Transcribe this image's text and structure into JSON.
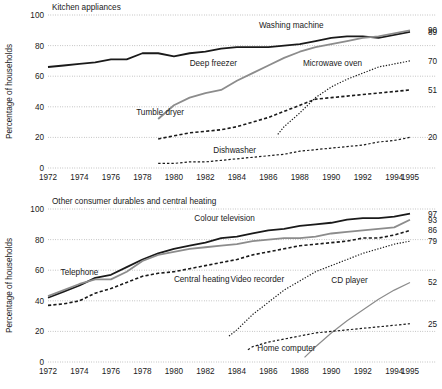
{
  "figure": {
    "axis_title": "Percentage of households",
    "x_ticks": [
      "1972",
      "1974",
      "1976",
      "1978",
      "1980",
      "1982",
      "1984",
      "1986",
      "1988",
      "1990",
      "1992",
      "1994",
      "1995"
    ],
    "x_tick_values": [
      1972,
      1974,
      1976,
      1978,
      1980,
      1982,
      1984,
      1986,
      1988,
      1990,
      1992,
      1994,
      1995
    ],
    "y_ticks": [
      "0",
      "20",
      "40",
      "60",
      "80",
      "100"
    ],
    "y_tick_values": [
      0,
      20,
      40,
      60,
      80,
      100
    ]
  },
  "chart_data": [
    {
      "type": "line",
      "title": "Kitchen appliances",
      "xlabel": "",
      "ylabel": "Percentage of households",
      "xlim": [
        1972,
        1995
      ],
      "ylim": [
        0,
        100
      ],
      "grid": true,
      "legend": "inline-annotations",
      "series": [
        {
          "name": "Washing machine",
          "end_label": "89",
          "color": "#1a1a1a",
          "width": 1.8,
          "dash": "none",
          "label_x": 1985.4,
          "label_y": 91.5,
          "x": [
            1972,
            1973,
            1974,
            1975,
            1976,
            1977,
            1978,
            1979,
            1980,
            1981,
            1982,
            1983,
            1984,
            1985,
            1986,
            1987,
            1988,
            1989,
            1990,
            1991,
            1992,
            1993,
            1994,
            1995
          ],
          "y": [
            66,
            67,
            68,
            69,
            71,
            71,
            75,
            75,
            73,
            75,
            76,
            78,
            79,
            79,
            79,
            80,
            81,
            83,
            85,
            86,
            86,
            85,
            87,
            89
          ]
        },
        {
          "name": "Deep freezer",
          "end_label": "90",
          "color": "#8c8c8c",
          "width": 1.8,
          "dash": "none",
          "label_x": 1981.0,
          "label_y": 66.5,
          "x": [
            1979,
            1980,
            1981,
            1982,
            1983,
            1984,
            1985,
            1986,
            1987,
            1988,
            1989,
            1990,
            1991,
            1992,
            1993,
            1994,
            1995
          ],
          "y": [
            32,
            41,
            46,
            49,
            51,
            57,
            62,
            67,
            72,
            76,
            79,
            81,
            83,
            85,
            86,
            88,
            90
          ]
        },
        {
          "name": "Tumble dryer",
          "end_label": "51",
          "color": "#1a1a1a",
          "width": 1.6,
          "dash": "3.2 2.2",
          "label_x": 1977.6,
          "label_y": 34.5,
          "x": [
            1979,
            1980,
            1981,
            1982,
            1983,
            1984,
            1985,
            1986,
            1987,
            1988,
            1989,
            1990,
            1991,
            1992,
            1993,
            1994,
            1995
          ],
          "y": [
            19,
            21,
            23,
            24,
            25,
            27,
            30,
            33,
            37,
            41,
            45,
            46,
            47,
            48,
            49,
            50,
            51
          ]
        },
        {
          "name": "Microwave oven",
          "end_label": "70",
          "color": "#1a1a1a",
          "width": 1.2,
          "dash": "1.3 1.6",
          "label_x": 1988.2,
          "label_y": 66.5,
          "x": [
            1986.6,
            1987,
            1988,
            1989,
            1990,
            1991,
            1992,
            1993,
            1994,
            1995
          ],
          "y": [
            22,
            27,
            36,
            46,
            53,
            58,
            62,
            66,
            68,
            70
          ]
        },
        {
          "name": "Dishwasher",
          "end_label": "20",
          "color": "#1a1a1a",
          "width": 1.2,
          "dash": "2.4 2.0",
          "label_x": 1982.5,
          "label_y": 10.0,
          "x": [
            1979,
            1980,
            1981,
            1982,
            1983,
            1984,
            1985,
            1986,
            1987,
            1988,
            1989,
            1990,
            1991,
            1992,
            1993,
            1994,
            1995
          ],
          "y": [
            3,
            3,
            4,
            4,
            5,
            6,
            7,
            8,
            9,
            11,
            12,
            13,
            14,
            15,
            17,
            18,
            20
          ]
        }
      ]
    },
    {
      "type": "line",
      "title": "Other consumer durables and central heating",
      "xlabel": "",
      "ylabel": "Percentage of households",
      "xlim": [
        1972,
        1995
      ],
      "ylim": [
        0,
        100
      ],
      "grid": true,
      "legend": "inline-annotations",
      "series": [
        {
          "name": "Colour television",
          "end_label": "97",
          "color": "#1a1a1a",
          "width": 1.8,
          "dash": "none",
          "label_x": 1981.3,
          "label_y": 92.0,
          "x": [
            1972,
            1973,
            1974,
            1975,
            1976,
            1977,
            1978,
            1979,
            1980,
            1981,
            1982,
            1983,
            1984,
            1985,
            1986,
            1987,
            1988,
            1989,
            1990,
            1991,
            1992,
            1993,
            1994,
            1995
          ],
          "y": [
            42,
            46,
            50,
            55,
            57,
            62,
            67,
            71,
            74,
            76,
            78,
            81,
            82,
            84,
            86,
            87,
            89,
            90,
            91,
            93,
            94,
            94,
            95,
            97
          ]
        },
        {
          "name": "Telephone",
          "end_label": "93",
          "color": "#8c8c8c",
          "width": 1.8,
          "dash": "none",
          "label_x": 1972.8,
          "label_y": 57.0,
          "x": [
            1972,
            1973,
            1974,
            1975,
            1976,
            1977,
            1978,
            1979,
            1980,
            1981,
            1982,
            1983,
            1984,
            1985,
            1986,
            1987,
            1988,
            1989,
            1990,
            1991,
            1992,
            1993,
            1994,
            1995
          ],
          "y": [
            43,
            47,
            51,
            54,
            54,
            59,
            66,
            70,
            72,
            74,
            75,
            76,
            77,
            79,
            80,
            81,
            81,
            82,
            84,
            85,
            86,
            87,
            88,
            93
          ]
        },
        {
          "name": "Central heating",
          "end_label": "86",
          "color": "#1a1a1a",
          "width": 1.6,
          "dash": "3.2 2.2",
          "label_x": 1980.0,
          "label_y": 52.0,
          "x": [
            1972,
            1973,
            1974,
            1975,
            1976,
            1977,
            1978,
            1979,
            1980,
            1981,
            1982,
            1983,
            1984,
            1985,
            1986,
            1987,
            1988,
            1989,
            1990,
            1991,
            1992,
            1993,
            1994,
            1995
          ],
          "y": [
            37,
            38,
            40,
            45,
            48,
            52,
            56,
            58,
            59,
            61,
            63,
            65,
            67,
            70,
            72,
            74,
            76,
            77,
            78,
            79,
            81,
            81,
            83,
            86
          ]
        },
        {
          "name": "Video recorder",
          "end_label": "79",
          "color": "#1a1a1a",
          "width": 1.2,
          "dash": "1.3 1.6",
          "label_x": 1983.6,
          "label_y": 52.0,
          "x": [
            1983.5,
            1984,
            1985,
            1986,
            1987,
            1988,
            1989,
            1990,
            1991,
            1992,
            1993,
            1994,
            1995
          ],
          "y": [
            17,
            21,
            31,
            39,
            47,
            53,
            59,
            63,
            67,
            71,
            74,
            77,
            79
          ]
        },
        {
          "name": "CD player",
          "end_label": "52",
          "color": "#8c8c8c",
          "width": 1.2,
          "dash": "none",
          "label_x": 1990.0,
          "label_y": 51.5,
          "x": [
            1988.3,
            1989,
            1990,
            1991,
            1992,
            1993,
            1994,
            1995
          ],
          "y": [
            3,
            10,
            19,
            27,
            34,
            41,
            47,
            52
          ]
        },
        {
          "name": "Home computer",
          "end_label": "25",
          "color": "#1a1a1a",
          "width": 1.2,
          "dash": "2.4 2.0",
          "label_x": 1985.3,
          "label_y": 7.0,
          "x": [
            1984.7,
            1985,
            1986,
            1987,
            1988,
            1989,
            1990,
            1991,
            1992,
            1993,
            1994,
            1995
          ],
          "y": [
            8,
            10,
            13,
            15,
            17,
            19,
            20,
            21,
            22,
            23,
            24,
            25
          ]
        }
      ]
    }
  ]
}
